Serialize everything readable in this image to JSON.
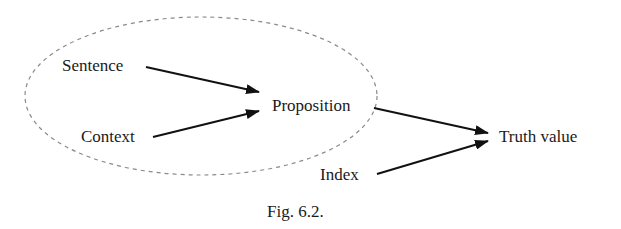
{
  "figure": {
    "caption": "Fig. 6.2.",
    "nodes": {
      "sentence": "Sentence",
      "context": "Context",
      "proposition": "Proposition",
      "index": "Index",
      "truth_value": "Truth value"
    },
    "edges": [
      {
        "from": "Sentence",
        "to": "Proposition"
      },
      {
        "from": "Context",
        "to": "Proposition"
      },
      {
        "from": "Proposition",
        "to": "Truth value"
      },
      {
        "from": "Index",
        "to": "Truth value"
      }
    ],
    "grouping": {
      "shape": "dashed-ellipse",
      "encloses": [
        "Sentence",
        "Context",
        "Proposition"
      ]
    },
    "colors": {
      "text": "#1a1a1a",
      "arrow": "#111111",
      "ellipse": "#8a8a8a"
    }
  }
}
